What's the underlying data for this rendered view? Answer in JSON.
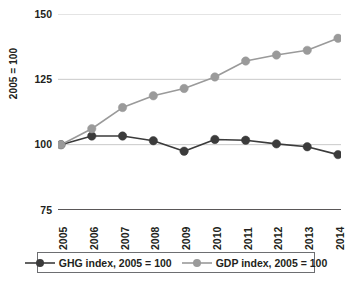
{
  "chart_data": {
    "type": "line",
    "title": "",
    "xlabel": "",
    "ylabel": "2005 = 100",
    "categories": [
      "2005",
      "2006",
      "2007",
      "2008",
      "2009",
      "2010",
      "2011",
      "2012",
      "2013",
      "2014"
    ],
    "x": [
      2005,
      2006,
      2007,
      2008,
      2009,
      2010,
      2011,
      2012,
      2013,
      2014
    ],
    "ylim": [
      75,
      150
    ],
    "yticks": [
      75,
      100,
      125,
      150
    ],
    "ytick_labels": [
      "75",
      "100",
      "125",
      "150"
    ],
    "grid": true,
    "legend_position": "bottom",
    "series": [
      {
        "name": "GHG index, 2005 = 100",
        "color": "#3b3b3b",
        "values": [
          100.0,
          103.3,
          103.3,
          101.5,
          97.5,
          102.0,
          101.7,
          100.3,
          99.2,
          96.2
        ]
      },
      {
        "name": "GDP index, 2005 = 100",
        "color": "#9a9a9a",
        "values": [
          100.0,
          106.1,
          114.2,
          118.7,
          121.5,
          125.9,
          132.0,
          134.3,
          136.1,
          140.7
        ]
      }
    ]
  },
  "axes": {
    "y_title": "2005 = 100",
    "y_tick_labels": [
      "150",
      "125",
      "100",
      "75"
    ],
    "x_tick_labels": [
      "2005",
      "2006",
      "2007",
      "2008",
      "2009",
      "2010",
      "2011",
      "2012",
      "2013",
      "2014"
    ]
  },
  "legend": {
    "items": [
      {
        "label": "GHG index, 2005 = 100",
        "color": "#3b3b3b"
      },
      {
        "label": "GDP index, 2005 = 100",
        "color": "#9a9a9a"
      }
    ]
  },
  "colors": {
    "ghg": "#3b3b3b",
    "gdp": "#9a9a9a",
    "grid": "#c9c9c9",
    "axis": "#231f20",
    "text": "#231f20",
    "background": "#ffffff"
  }
}
